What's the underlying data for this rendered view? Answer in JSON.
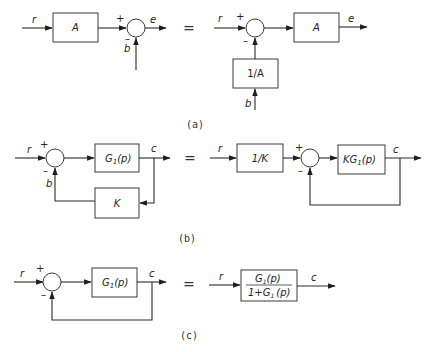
{
  "figure": {
    "panel_a": {
      "caption": "(a)",
      "left": {
        "input": "r",
        "block": "A",
        "plus": "+",
        "minus": "–",
        "disturbance": "b",
        "output": "e"
      },
      "equals": "=",
      "right": {
        "input": "r",
        "plus": "+",
        "minus": "–",
        "block": "A",
        "output": "e",
        "feed_block": "1/A",
        "disturbance": "b"
      }
    },
    "panel_b": {
      "caption": "(b)",
      "left": {
        "input": "r",
        "plus": "+",
        "minus": "–",
        "forward_block": "G1(p)",
        "forward_main": "G",
        "forward_sub": "1",
        "forward_arg": "(p)",
        "output": "c",
        "feedback_block": "K",
        "feedback_signal": "b"
      },
      "equals": "=",
      "right": {
        "input": "r",
        "pre_block": "1/K",
        "plus": "+",
        "minus": "–",
        "forward_block": "KG1(p)",
        "forward_main": "KG",
        "forward_sub": "1",
        "forward_arg": "(p)",
        "output": "c"
      }
    },
    "panel_c": {
      "caption": "(c)",
      "left": {
        "input": "r",
        "plus": "+",
        "minus": "–",
        "forward_block": "G1(p)",
        "forward_main": "G",
        "forward_sub": "1",
        "forward_arg": "(p)",
        "output": "c"
      },
      "equals": "=",
      "right": {
        "input": "r",
        "numerator_main": "G",
        "numerator_sub": "1",
        "numerator_arg": "(p)",
        "denominator_prefix": "1+G",
        "denominator_sub": "1",
        "denominator_arg": "(p)",
        "block": "G1(p) / (1+G1(p))",
        "output": "c"
      }
    }
  }
}
